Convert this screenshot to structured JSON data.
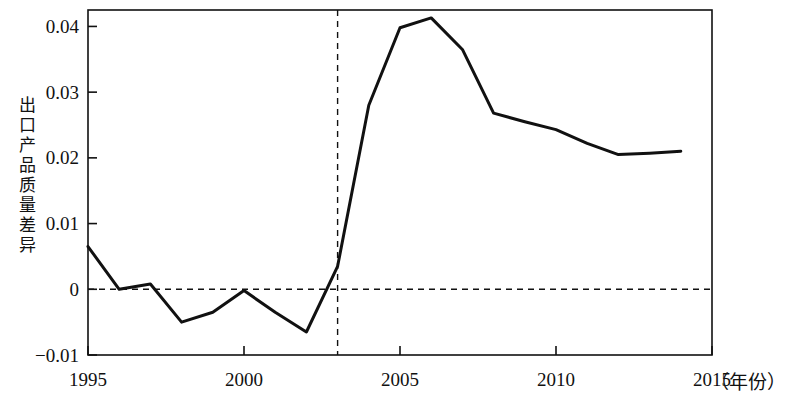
{
  "chart_data": {
    "type": "line",
    "title": "",
    "subtitle": "",
    "xlabel": "（年份）",
    "ylabel": "出口产品质量差异",
    "ylabel_chars": [
      "出",
      "口",
      "产",
      "品",
      "质",
      "量",
      "差",
      "异"
    ],
    "xlim": [
      1995,
      2015
    ],
    "ylim": [
      -0.01,
      0.0425
    ],
    "xticks": [
      1995,
      2000,
      2005,
      2010,
      2015
    ],
    "xtick_labels": [
      "1995",
      "2000",
      "2005",
      "2010",
      "2015"
    ],
    "yticks": [
      0.04,
      0.03,
      0.02,
      0.01,
      0,
      -0.01
    ],
    "ytick_labels": [
      "0.04",
      "0.03",
      "0.02",
      "0.01",
      "0",
      "−0.01"
    ],
    "grid": false,
    "legend": "none",
    "line_color": "#111111",
    "line_width": 3,
    "x": [
      1995,
      1996,
      1997,
      1998,
      1999,
      2000,
      2001,
      2002,
      2003,
      2004,
      2005,
      2006,
      2007,
      2008,
      2009,
      2010,
      2011,
      2012,
      2013,
      2014
    ],
    "values": [
      0.0065,
      0.0,
      0.0008,
      -0.005,
      -0.0035,
      -0.0002,
      -0.0035,
      -0.0065,
      0.0035,
      0.028,
      0.0398,
      0.0413,
      0.0365,
      0.0268,
      0.0255,
      0.0243,
      0.0222,
      0.0205,
      0.0207,
      0.021
    ],
    "series": [
      {
        "name": "出口产品质量差异",
        "values": [
          0.0065,
          0.0,
          0.0008,
          -0.005,
          -0.0035,
          -0.0002,
          -0.0035,
          -0.0065,
          0.0035,
          0.028,
          0.0398,
          0.0413,
          0.0365,
          0.0268,
          0.0255,
          0.0243,
          0.0222,
          0.0205,
          0.0207,
          0.021
        ]
      }
    ],
    "reference_lines": [
      {
        "name": "zero-line",
        "orientation": "horizontal",
        "value": 0,
        "style": "dashed",
        "color": "#111111"
      },
      {
        "name": "year-2003-line",
        "orientation": "vertical",
        "value": 2003,
        "style": "dashed",
        "color": "#111111"
      }
    ]
  }
}
